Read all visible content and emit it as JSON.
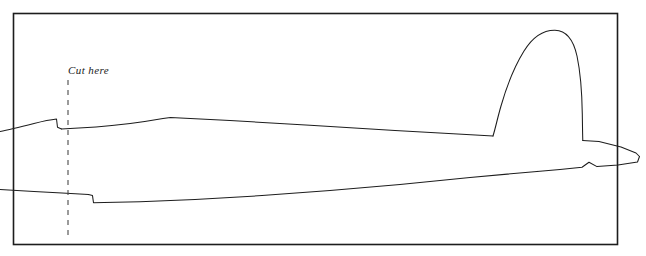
{
  "figure": {
    "kind": "technical-line-drawing",
    "background_color": "#ffffff",
    "line_color": "#1d1d1d",
    "border": {
      "present": true,
      "color": "#1d1d1d",
      "stroke_width": 1.6,
      "x": 13,
      "y": 13,
      "width": 605,
      "height": 232
    },
    "annotations": {
      "cut_here_label": "Cut here",
      "cut_line": {
        "style": "dashed",
        "x": 68,
        "y_start": 80,
        "y_end": 240,
        "dash": "5 5",
        "color": "#4a4a4a",
        "stroke_width": 1.1
      }
    },
    "paths": {
      "fuselage_top": "M 0,130 C 12,128 26,125 40,122 C 48,120 54,119 57,119 L 58,128 L 61,129 L 170,118 L 300,125 L 420,132 L 495,136 L 497,136",
      "tail_fin": "M 497,136 C 500,120 506,92 518,66 C 528,45 542,31 556,30 C 568,29 576,42 579,62 C 582,84 583,112 583,134 L 584,142",
      "tail_stabilizer": "M 584,142 L 601,143 L 630,150 L 640,156 L 637,162 L 614,166 L 592,167 L 586,162 L 579,167 L 560,169 L 540,171",
      "fuselage_bottom_rear": "M 540,171 L 460,180 L 380,189 L 300,196 L 220,201 L 150,203 L 100,203 L 92,203 L 91,196 L 88,195 L 0,190",
      "wing_step_upper": "M 57,119 L 58,128 L 61,129",
      "wing_step_lower": "M 88,195 L 91,196 L 92,203"
    }
  }
}
